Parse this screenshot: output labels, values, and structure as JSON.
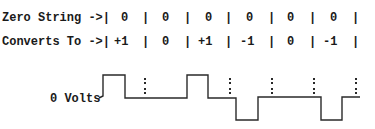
{
  "rows": {
    "zero_string": {
      "label": "Zero String ->|",
      "cells": [
        "0",
        "0",
        "0",
        "0",
        "0",
        "0"
      ]
    },
    "converts_to": {
      "label": "Converts To ->|",
      "cells": [
        "+1",
        "0",
        "+1",
        "-1",
        "0",
        "-1"
      ]
    }
  },
  "waveform": {
    "baseline_label": "0 Volts",
    "levels": [
      1,
      0,
      1,
      -1,
      0,
      -1
    ]
  },
  "separator": "|"
}
